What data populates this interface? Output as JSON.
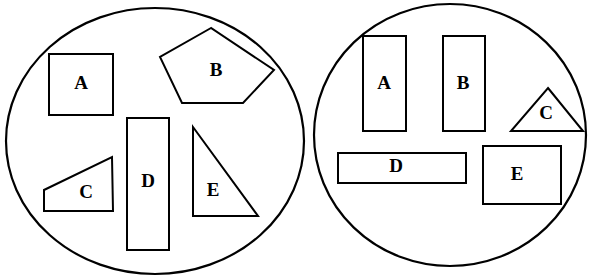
{
  "figure": {
    "background_color": "#ffffff",
    "stroke_color": "#000000",
    "width": 599,
    "height": 280
  },
  "groups": [
    {
      "name": "left-circle",
      "label": "Left circle",
      "center_x": 155,
      "center_y": 141,
      "radius_x": 149,
      "radius_y": 133,
      "shapes": [
        {
          "id": "left-shape-a",
          "label": "A",
          "kind": "rectangle",
          "label_x": 81,
          "label_y": 85,
          "points": "49,54 113,54 113,115 49,115"
        },
        {
          "id": "left-shape-b",
          "label": "B",
          "kind": "pentagon",
          "label_x": 216,
          "label_y": 72,
          "points": "211,28 160,57 182,103 243,103 274,70"
        },
        {
          "id": "left-shape-c",
          "label": "C",
          "kind": "trapezoid",
          "label_x": 86,
          "label_y": 194,
          "points": "112,157 113,211 44,211 44,190"
        },
        {
          "id": "left-shape-d",
          "label": "D",
          "kind": "rectangle",
          "label_x": 148,
          "label_y": 183,
          "points": "127,118 169,118 169,250 127,250"
        },
        {
          "id": "left-shape-e",
          "label": "E",
          "kind": "triangle",
          "label_x": 213,
          "label_y": 192,
          "points": "193,127 258,216 193,216"
        }
      ]
    },
    {
      "name": "right-circle",
      "label": "Right circle",
      "center_x": 450,
      "center_y": 135,
      "radius_x": 136,
      "radius_y": 131,
      "shapes": [
        {
          "id": "right-shape-a",
          "label": "A",
          "kind": "rectangle",
          "label_x": 384,
          "label_y": 85,
          "points": "363,36 406,36 406,131 363,131"
        },
        {
          "id": "right-shape-b",
          "label": "B",
          "kind": "rectangle",
          "label_x": 463,
          "label_y": 85,
          "points": "443,36 485,36 485,131 443,131"
        },
        {
          "id": "right-shape-c",
          "label": "C",
          "kind": "triangle",
          "label_x": 546,
          "label_y": 115,
          "points": "548,88 583,131 511,131"
        },
        {
          "id": "right-shape-d",
          "label": "D",
          "kind": "rectangle",
          "label_x": 396,
          "label_y": 168,
          "points": "338,153 466,153 466,183 338,183"
        },
        {
          "id": "right-shape-e",
          "label": "E",
          "kind": "rectangle",
          "label_x": 517,
          "label_y": 176,
          "points": "483,146 561,146 561,204 483,204"
        }
      ]
    }
  ]
}
